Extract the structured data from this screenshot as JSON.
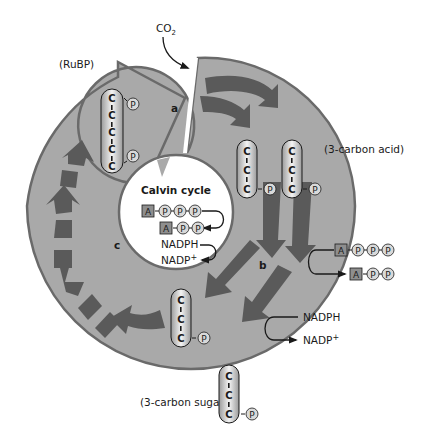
{
  "title": "Calvin cycle",
  "inputs": {
    "co2": {
      "main": "CO",
      "sub": "2"
    }
  },
  "molecules": {
    "rubp": {
      "label": "(RuBP)",
      "carbons": [
        "C",
        "C",
        "C",
        "C",
        "C"
      ],
      "phosphates": [
        "P",
        "P"
      ]
    },
    "three_carbon_acid": {
      "label": "(3-carbon acid)",
      "carbons": [
        "C",
        "C",
        "C"
      ],
      "phosphate": "P",
      "count": 2
    },
    "three_carbon_sugar_inring": {
      "carbons": [
        "C",
        "C",
        "C"
      ],
      "phosphate": "P"
    },
    "three_carbon_sugar_out": {
      "label": "(3-carbon sugar)",
      "carbons": [
        "C",
        "C",
        "C"
      ],
      "phosphate": "P"
    }
  },
  "stages": {
    "a": "a",
    "b": "b",
    "c": "c"
  },
  "inner_energy": {
    "atp": {
      "adenine": "A",
      "phosphates": [
        "P",
        "P",
        "P"
      ]
    },
    "adp": {
      "adenine": "A",
      "phosphates": [
        "P",
        "P"
      ]
    },
    "nadph": "NADPH",
    "nadp": {
      "main": "NADP",
      "sup": "+"
    }
  },
  "outer_energy": {
    "atp": {
      "adenine": "A",
      "phosphates": [
        "P",
        "P",
        "P"
      ]
    },
    "adp": {
      "adenine": "A",
      "phosphates": [
        "P",
        "P"
      ]
    },
    "nadph": "NADPH",
    "nadp": {
      "main": "NADP",
      "sup": "+"
    }
  },
  "colors": {
    "ring_fill": "#a9a9a9",
    "ring_stroke": "#6a6a6a",
    "arrow_fill": "#5a5a5a",
    "capsule_light": "#f4f4f4",
    "capsule_dark": "#9a9a9a",
    "adenine_box": "#8e8e8e",
    "phosphate_fill": "#d9d9d9",
    "text": "#1a1a1a"
  }
}
